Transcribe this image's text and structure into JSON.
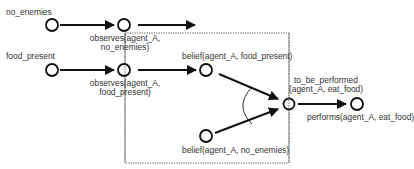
{
  "diagram": {
    "type": "causal-network",
    "colors": {
      "stroke": "#111111",
      "text": "#333333",
      "box": "#555555",
      "background": "#ffffff"
    },
    "nodes": [
      {
        "id": "no_enemies",
        "label": "no_enemies",
        "x": 52,
        "y": 25
      },
      {
        "id": "observes_no_enemies",
        "label_line1": "observes(agent_A,",
        "label_line2": "no_enemies)",
        "x": 124,
        "y": 25
      },
      {
        "id": "food_present",
        "label": "food_present",
        "x": 52,
        "y": 70
      },
      {
        "id": "observes_food_present",
        "label_line1": "observes(agent_A,",
        "label_line2": "food_present)",
        "x": 124,
        "y": 70
      },
      {
        "id": "belief_food_present",
        "label": "belief(agent_A, food_present)",
        "x": 206,
        "y": 70
      },
      {
        "id": "belief_no_enemies",
        "label": "belief(agent_A, no_enemies)",
        "x": 206,
        "y": 136
      },
      {
        "id": "to_be_performed",
        "label_line1": "to_be_performed",
        "label_line2": "(agent_A, eat_food)",
        "x": 289,
        "y": 104
      },
      {
        "id": "performs",
        "label": "performs(agent_A, eat_food)",
        "x": 357,
        "y": 104
      }
    ],
    "edges": [
      {
        "from": "no_enemies",
        "to": "observes_no_enemies"
      },
      {
        "from": "observes_no_enemies",
        "to": "(off-right)"
      },
      {
        "from": "food_present",
        "to": "observes_food_present"
      },
      {
        "from": "observes_food_present",
        "to": "belief_food_present"
      },
      {
        "from": "belief_food_present",
        "to": "to_be_performed",
        "combined_with": "belief_no_enemies"
      },
      {
        "from": "belief_no_enemies",
        "to": "to_be_performed",
        "combined_with": "belief_food_present"
      },
      {
        "from": "to_be_performed",
        "to": "performs"
      }
    ],
    "box": {
      "style": "dotted",
      "left": 125,
      "top": 33,
      "right": 289,
      "bottom": 163
    },
    "caption": "Fig. 2. Example of a causal network ... SCANDAL ..."
  }
}
